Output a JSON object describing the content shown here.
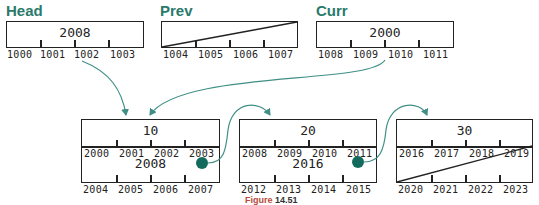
{
  "pointers": {
    "head": {
      "label": "Head",
      "value": "2008",
      "addresses": [
        "1000",
        "1001",
        "1002",
        "1003"
      ]
    },
    "prev": {
      "label": "Prev",
      "value": "",
      "null": true,
      "addresses": [
        "1004",
        "1005",
        "1006",
        "1007"
      ]
    },
    "curr": {
      "label": "Curr",
      "value": "2000",
      "addresses": [
        "1008",
        "1009",
        "1010",
        "1011"
      ]
    }
  },
  "nodes": [
    {
      "data": "10",
      "data_addresses": [
        "2000",
        "2001",
        "2002",
        "2003"
      ],
      "next": "2008",
      "next_addresses": [
        "2004",
        "2005",
        "2006",
        "2007"
      ]
    },
    {
      "data": "20",
      "data_addresses": [
        "2008",
        "2009",
        "2010",
        "2011"
      ],
      "next": "2016",
      "next_addresses": [
        "2012",
        "2013",
        "2014",
        "2015"
      ]
    },
    {
      "data": "30",
      "data_addresses": [
        "2016",
        "2017",
        "2018",
        "2019"
      ],
      "next": "",
      "next_null": true,
      "next_addresses": [
        "2020",
        "2021",
        "2022",
        "2023"
      ]
    }
  ],
  "caption": {
    "figure": "Figure",
    "number": "14.51"
  },
  "colors": {
    "accent": "#2a7a6c",
    "dot": "#136b5e",
    "arrow": "#3f8f86"
  }
}
